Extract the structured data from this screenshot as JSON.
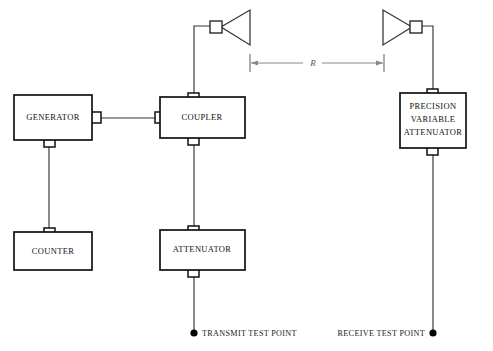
{
  "diagram": {
    "colors": {
      "box_stroke": "#111111",
      "wire": "#333333",
      "dimension": "#888888",
      "background": "#ffffff",
      "text": "#111111"
    },
    "units": [
      {
        "id": "generator",
        "label": "GENERATOR"
      },
      {
        "id": "coupler",
        "label": "COUPLER"
      },
      {
        "id": "counter",
        "label": "COUNTER"
      },
      {
        "id": "attenuator",
        "label": "ATTENUATOR"
      }
    ],
    "precision_attenuator": {
      "line1": "PRECISION",
      "line2": "VARIABLE",
      "line3": "ATTENUATOR"
    },
    "dimension": {
      "label": "R"
    },
    "test_points": [
      {
        "id": "transmit",
        "label": "TRANSMIT TEST POINT"
      },
      {
        "id": "receive",
        "label": "RECEIVE TEST POINT"
      }
    ],
    "antennas": [
      {
        "id": "transmit-antenna",
        "icon": "horn-antenna-icon"
      },
      {
        "id": "receive-antenna",
        "icon": "horn-antenna-icon"
      }
    ]
  }
}
